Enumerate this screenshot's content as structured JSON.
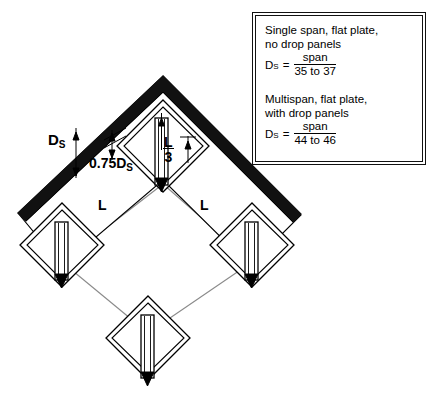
{
  "note_box": {
    "block1": {
      "line1": "Single span, flat plate,",
      "line2": "no drop panels",
      "symbol": "D",
      "subscript": "S",
      "equals": "=",
      "numerator": "span",
      "denominator": "35 to 37"
    },
    "block2": {
      "line1": "Multispan, flat plate,",
      "line2": "with drop panels",
      "symbol": "D",
      "subscript": "S",
      "equals": "=",
      "numerator": "span",
      "denominator": "44 to 46"
    }
  },
  "diagram": {
    "labels": {
      "slab_thickness": "D",
      "slab_thickness_sub": "S",
      "drop_panel_thickness": "0.75D",
      "drop_panel_thickness_sub": "S",
      "span_left": "L",
      "span_right": "L",
      "drop_panel_extent_num": "L",
      "drop_panel_extent_den": "3"
    },
    "colors": {
      "slab_edge": "#000000",
      "grid_line": "#7a7a7a",
      "column_fill": "#ffffff",
      "column_tip": "#000000",
      "outline": "#000000"
    },
    "elements": {
      "slab": "flat-plate-slab",
      "columns": [
        "column-top",
        "column-left",
        "column-right",
        "column-bottom"
      ],
      "drop_panels": [
        "drop-panel-top",
        "drop-panel-left",
        "drop-panel-right",
        "drop-panel-bottom"
      ]
    }
  }
}
